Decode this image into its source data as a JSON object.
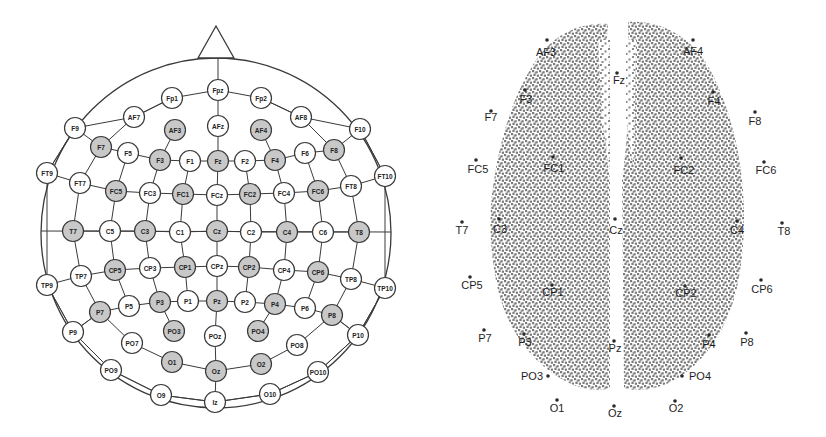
{
  "left_panel": {
    "title": "10-10 electrode montage (head schematic)",
    "colors": {
      "highlight_fill": "#c8c8c8",
      "normal_fill": "#ffffff",
      "stroke": "#3a3a3a"
    },
    "head": {
      "cx": 216,
      "cy": 233,
      "r": 175,
      "nose": [
        [
          198,
          58
        ],
        [
          216,
          26
        ],
        [
          234,
          58
        ]
      ]
    },
    "electrodes": [
      {
        "label": "Fpz",
        "x": 218,
        "y": 90,
        "hl": false
      },
      {
        "label": "Fp1",
        "x": 172,
        "y": 98,
        "hl": false
      },
      {
        "label": "Fp2",
        "x": 261,
        "y": 98,
        "hl": false
      },
      {
        "label": "AF7",
        "x": 134,
        "y": 117,
        "hl": false
      },
      {
        "label": "AF8",
        "x": 301,
        "y": 117,
        "hl": false
      },
      {
        "label": "F9",
        "x": 75,
        "y": 128,
        "hl": false
      },
      {
        "label": "F10",
        "x": 360,
        "y": 129,
        "hl": false
      },
      {
        "label": "AF3",
        "x": 175,
        "y": 130,
        "hl": true
      },
      {
        "label": "AFz",
        "x": 218,
        "y": 126,
        "hl": false
      },
      {
        "label": "AF4",
        "x": 261,
        "y": 130,
        "hl": true
      },
      {
        "label": "F7",
        "x": 101,
        "y": 147,
        "hl": true
      },
      {
        "label": "F5",
        "x": 128,
        "y": 153,
        "hl": false
      },
      {
        "label": "F3",
        "x": 160,
        "y": 160,
        "hl": true
      },
      {
        "label": "F1",
        "x": 190,
        "y": 161,
        "hl": false
      },
      {
        "label": "Fz",
        "x": 218,
        "y": 161,
        "hl": true
      },
      {
        "label": "F2",
        "x": 245,
        "y": 161,
        "hl": false
      },
      {
        "label": "F4",
        "x": 275,
        "y": 160,
        "hl": true
      },
      {
        "label": "F6",
        "x": 305,
        "y": 153,
        "hl": false
      },
      {
        "label": "F8",
        "x": 334,
        "y": 150,
        "hl": true
      },
      {
        "label": "FT9",
        "x": 47,
        "y": 173,
        "hl": false
      },
      {
        "label": "FT10",
        "x": 385,
        "y": 176,
        "hl": false
      },
      {
        "label": "FT7",
        "x": 80,
        "y": 183,
        "hl": false
      },
      {
        "label": "FC5",
        "x": 116,
        "y": 191,
        "hl": true
      },
      {
        "label": "FC3",
        "x": 150,
        "y": 193,
        "hl": false
      },
      {
        "label": "FC1",
        "x": 183,
        "y": 194,
        "hl": true
      },
      {
        "label": "FCz",
        "x": 217,
        "y": 195,
        "hl": false
      },
      {
        "label": "FC2",
        "x": 250,
        "y": 194,
        "hl": true
      },
      {
        "label": "FC4",
        "x": 284,
        "y": 193,
        "hl": false
      },
      {
        "label": "FC6",
        "x": 318,
        "y": 191,
        "hl": true
      },
      {
        "label": "FT8",
        "x": 351,
        "y": 186,
        "hl": false
      },
      {
        "label": "T7",
        "x": 73,
        "y": 231,
        "hl": true
      },
      {
        "label": "C5",
        "x": 110,
        "y": 231,
        "hl": false
      },
      {
        "label": "C3",
        "x": 145,
        "y": 231,
        "hl": true
      },
      {
        "label": "C1",
        "x": 180,
        "y": 232,
        "hl": false
      },
      {
        "label": "Cz",
        "x": 217,
        "y": 231,
        "hl": true
      },
      {
        "label": "C2",
        "x": 251,
        "y": 232,
        "hl": false
      },
      {
        "label": "C4",
        "x": 287,
        "y": 232,
        "hl": true
      },
      {
        "label": "C6",
        "x": 323,
        "y": 232,
        "hl": false
      },
      {
        "label": "T8",
        "x": 359,
        "y": 232,
        "hl": true
      },
      {
        "label": "TP9",
        "x": 47,
        "y": 285,
        "hl": false
      },
      {
        "label": "TP7",
        "x": 81,
        "y": 276,
        "hl": false
      },
      {
        "label": "CP5",
        "x": 115,
        "y": 270,
        "hl": true
      },
      {
        "label": "CP3",
        "x": 150,
        "y": 268,
        "hl": false
      },
      {
        "label": "CP1",
        "x": 185,
        "y": 267,
        "hl": true
      },
      {
        "label": "CPz",
        "x": 217,
        "y": 266,
        "hl": false
      },
      {
        "label": "CP2",
        "x": 249,
        "y": 267,
        "hl": true
      },
      {
        "label": "CP4",
        "x": 284,
        "y": 270,
        "hl": false
      },
      {
        "label": "CP6",
        "x": 318,
        "y": 272,
        "hl": true
      },
      {
        "label": "TP8",
        "x": 351,
        "y": 279,
        "hl": false
      },
      {
        "label": "TP10",
        "x": 385,
        "y": 288,
        "hl": false
      },
      {
        "label": "P7",
        "x": 100,
        "y": 312,
        "hl": true
      },
      {
        "label": "P5",
        "x": 129,
        "y": 306,
        "hl": false
      },
      {
        "label": "P3",
        "x": 160,
        "y": 302,
        "hl": true
      },
      {
        "label": "P1",
        "x": 188,
        "y": 301,
        "hl": false
      },
      {
        "label": "Pz",
        "x": 217,
        "y": 301,
        "hl": true
      },
      {
        "label": "P2",
        "x": 245,
        "y": 302,
        "hl": false
      },
      {
        "label": "P4",
        "x": 275,
        "y": 304,
        "hl": true
      },
      {
        "label": "P6",
        "x": 305,
        "y": 308,
        "hl": false
      },
      {
        "label": "P8",
        "x": 332,
        "y": 315,
        "hl": true
      },
      {
        "label": "P9",
        "x": 73,
        "y": 332,
        "hl": false
      },
      {
        "label": "PO7",
        "x": 132,
        "y": 343,
        "hl": false
      },
      {
        "label": "PO3",
        "x": 174,
        "y": 331,
        "hl": true
      },
      {
        "label": "POz",
        "x": 215,
        "y": 336,
        "hl": false
      },
      {
        "label": "PO4",
        "x": 258,
        "y": 331,
        "hl": true
      },
      {
        "label": "PO8",
        "x": 297,
        "y": 345,
        "hl": false
      },
      {
        "label": "P10",
        "x": 358,
        "y": 335,
        "hl": false
      },
      {
        "label": "PO9",
        "x": 111,
        "y": 370,
        "hl": false
      },
      {
        "label": "O1",
        "x": 172,
        "y": 362,
        "hl": true
      },
      {
        "label": "Oz",
        "x": 216,
        "y": 371,
        "hl": true
      },
      {
        "label": "O2",
        "x": 261,
        "y": 364,
        "hl": true
      },
      {
        "label": "PO10",
        "x": 318,
        "y": 372,
        "hl": false
      },
      {
        "label": "O9",
        "x": 161,
        "y": 395,
        "hl": false
      },
      {
        "label": "Iz",
        "x": 215,
        "y": 402,
        "hl": false
      },
      {
        "label": "O10",
        "x": 270,
        "y": 394,
        "hl": false
      }
    ],
    "rows": [
      [
        "Fp1",
        "Fpz",
        "Fp2"
      ],
      [
        "AF7",
        "Fp1"
      ],
      [
        "Fp2",
        "AF8"
      ],
      [
        "F9",
        "F7",
        "F5",
        "F3",
        "F1",
        "Fz",
        "F2",
        "F4",
        "F6",
        "F8",
        "F10"
      ],
      [
        "FT9",
        "FT7",
        "FC5",
        "FC3",
        "FC1",
        "FCz",
        "FC2",
        "FC4",
        "FC6",
        "FT8",
        "FT10"
      ],
      [
        "C5",
        "C3",
        "C1",
        "Cz",
        "C2",
        "C4",
        "C6"
      ],
      [
        "T7",
        "C5"
      ],
      [
        "C6",
        "T8"
      ],
      [
        "TP9",
        "TP7",
        "CP5",
        "CP3",
        "CP1",
        "CPz",
        "CP2",
        "CP4",
        "CP6",
        "TP8",
        "TP10"
      ],
      [
        "P7",
        "P5",
        "P3",
        "P1",
        "Pz",
        "P2",
        "P4",
        "P6",
        "P8"
      ],
      [
        "P9",
        "P7"
      ],
      [
        "P8",
        "P10"
      ],
      [
        "PO7",
        "O1",
        "Oz",
        "O2",
        "PO8"
      ],
      [
        "PO9",
        "O9",
        "Iz",
        "O10",
        "PO10"
      ]
    ],
    "columns": [
      [
        "Fpz",
        "AFz",
        "Fz",
        "FCz",
        "Cz",
        "CPz",
        "Pz",
        "POz",
        "Oz",
        "Iz"
      ],
      [
        "AF7",
        "F7"
      ],
      [
        "AF8",
        "F8"
      ],
      [
        "AF3",
        "F3"
      ],
      [
        "AF4",
        "F4"
      ],
      [
        "F9",
        "FT9"
      ],
      [
        "F10",
        "FT10"
      ],
      [
        "F7",
        "FT7",
        "T7",
        "TP7",
        "P7",
        "PO7"
      ],
      [
        "F8",
        "FT8",
        "T8",
        "TP8",
        "P8",
        "PO8"
      ],
      [
        "F5",
        "FC5",
        "C5",
        "CP5",
        "P5"
      ],
      [
        "F6",
        "FC6",
        "C6",
        "CP6",
        "P6"
      ],
      [
        "F3",
        "FC3",
        "C3",
        "CP3",
        "P3",
        "PO3"
      ],
      [
        "F4",
        "FC4",
        "C4",
        "CP4",
        "P4",
        "PO4"
      ],
      [
        "F1",
        "FC1",
        "C1",
        "CP1",
        "P1"
      ],
      [
        "F2",
        "FC2",
        "C2",
        "CP2",
        "P2"
      ],
      [
        "TP9",
        "P9",
        "PO9"
      ],
      [
        "TP10",
        "P10",
        "PO10"
      ],
      [
        "P7",
        "P9"
      ],
      [
        "P8",
        "P10"
      ]
    ]
  },
  "right_panel": {
    "title": "Source point cloud on brain (top view)",
    "colors": {
      "cloud": "#7a7a7a",
      "label": "#1e1e1e",
      "dot": "#2a2a2a"
    },
    "electrodes": [
      {
        "label": "AF3",
        "dx": 547,
        "dy": 40,
        "lx": 546,
        "ly": 52
      },
      {
        "label": "AF4",
        "dx": 693,
        "dy": 40,
        "lx": 693,
        "ly": 51
      },
      {
        "label": "Fz",
        "dx": 617,
        "dy": 73,
        "lx": 619,
        "ly": 80
      },
      {
        "label": "F3",
        "dx": 525,
        "dy": 90,
        "lx": 526,
        "ly": 99
      },
      {
        "label": "F4",
        "dx": 713,
        "dy": 92,
        "lx": 714,
        "ly": 101
      },
      {
        "label": "F7",
        "dx": 491,
        "dy": 111,
        "lx": 491,
        "ly": 117
      },
      {
        "label": "F8",
        "dx": 755,
        "dy": 112,
        "lx": 755,
        "ly": 121
      },
      {
        "label": "FC5",
        "dx": 476,
        "dy": 160,
        "lx": 478,
        "ly": 169
      },
      {
        "label": "FC1",
        "dx": 553,
        "dy": 157,
        "lx": 554,
        "ly": 168
      },
      {
        "label": "FC2",
        "dx": 681,
        "dy": 158,
        "lx": 684,
        "ly": 170
      },
      {
        "label": "FC6",
        "dx": 764,
        "dy": 162,
        "lx": 766,
        "ly": 170
      },
      {
        "label": "T7",
        "dx": 462,
        "dy": 222,
        "lx": 462,
        "ly": 230
      },
      {
        "label": "C3",
        "dx": 499,
        "dy": 219,
        "lx": 500,
        "ly": 229
      },
      {
        "label": "Cz",
        "dx": 615,
        "dy": 219,
        "lx": 616,
        "ly": 230
      },
      {
        "label": "C4",
        "dx": 737,
        "dy": 221,
        "lx": 737,
        "ly": 230
      },
      {
        "label": "T8",
        "dx": 782,
        "dy": 223,
        "lx": 784,
        "ly": 231
      },
      {
        "label": "CP5",
        "dx": 470,
        "dy": 277,
        "lx": 472,
        "ly": 285
      },
      {
        "label": "CP1",
        "dx": 552,
        "dy": 285,
        "lx": 553,
        "ly": 292
      },
      {
        "label": "CP2",
        "dx": 685,
        "dy": 286,
        "lx": 686,
        "ly": 293
      },
      {
        "label": "CP6",
        "dx": 761,
        "dy": 280,
        "lx": 762,
        "ly": 289
      },
      {
        "label": "P7",
        "dx": 484,
        "dy": 330,
        "lx": 485,
        "ly": 338
      },
      {
        "label": "P3",
        "dx": 524,
        "dy": 334,
        "lx": 525,
        "ly": 342
      },
      {
        "label": "Pz",
        "dx": 614,
        "dy": 341,
        "lx": 615,
        "ly": 348
      },
      {
        "label": "P4",
        "dx": 709,
        "dy": 335,
        "lx": 709,
        "ly": 344
      },
      {
        "label": "P8",
        "dx": 746,
        "dy": 333,
        "lx": 747,
        "ly": 342
      },
      {
        "label": "PO3",
        "dx": 548,
        "dy": 376,
        "lx": 532,
        "ly": 376
      },
      {
        "label": "PO4",
        "dx": 682,
        "dy": 376,
        "lx": 700,
        "ly": 376
      },
      {
        "label": "O1",
        "dx": 557,
        "dy": 400,
        "lx": 557,
        "ly": 408
      },
      {
        "label": "Oz",
        "dx": 614,
        "dy": 406,
        "lx": 615,
        "ly": 413
      },
      {
        "label": "O2",
        "dx": 675,
        "dy": 401,
        "lx": 676,
        "ly": 408
      }
    ]
  }
}
